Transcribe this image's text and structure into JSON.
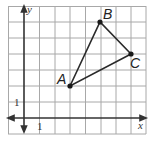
{
  "diagram": {
    "type": "coordinate-plane-triangle",
    "axes": {
      "x_label": "x",
      "y_label": "y"
    },
    "tick_labels": {
      "x": "1",
      "y": "1"
    },
    "grid": {
      "x_min": -1,
      "x_max": 8,
      "y_min": -1,
      "y_max": 7,
      "step": 1
    },
    "points": [
      {
        "label": "A",
        "x": 3,
        "y": 2
      },
      {
        "label": "B",
        "x": 5,
        "y": 6
      },
      {
        "label": "C",
        "x": 7,
        "y": 4
      }
    ],
    "colors": {
      "grid": "#9a9a9a",
      "axis": "#333333",
      "triangle": "#2a2a2a"
    }
  }
}
